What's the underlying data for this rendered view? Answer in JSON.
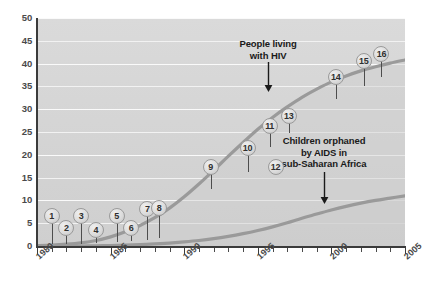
{
  "chart_data": {
    "type": "line",
    "title": "",
    "xlabel": "",
    "ylabel": "",
    "xlim": [
      1980,
      2005
    ],
    "ylim": [
      0,
      50
    ],
    "grid": true,
    "legend_position": "inline-annotations",
    "y_ticks": [
      0,
      5,
      10,
      15,
      20,
      25,
      30,
      35,
      40,
      45,
      50
    ],
    "x_ticks": [
      1980,
      1985,
      1990,
      1995,
      2000,
      2005
    ],
    "x_tick_labels": [
      "1980",
      "1985",
      "1990",
      "1995",
      "2000",
      "2005"
    ],
    "series": [
      {
        "name": "People living with HIV",
        "color": "#9a9a9a",
        "x": [
          1980,
          1981,
          1982,
          1983,
          1984,
          1985,
          1986,
          1987,
          1988,
          1989,
          1990,
          1991,
          1992,
          1993,
          1994,
          1995,
          1996,
          1997,
          1998,
          1999,
          2000,
          2001,
          2002,
          2003,
          2004,
          2005
        ],
        "values": [
          0.1,
          0.2,
          0.4,
          0.7,
          1.2,
          2.0,
          3.1,
          4.5,
          6.2,
          8.3,
          10.8,
          13.6,
          16.6,
          19.7,
          22.7,
          25.6,
          28.2,
          30.5,
          32.6,
          34.4,
          36.0,
          37.3,
          38.4,
          39.3,
          40.1,
          40.8
        ]
      },
      {
        "name": "Children orphaned by AIDS in sub-Saharan Africa",
        "color": "#9a9a9a",
        "x": [
          1980,
          1981,
          1982,
          1983,
          1984,
          1985,
          1986,
          1987,
          1988,
          1989,
          1990,
          1991,
          1992,
          1993,
          1994,
          1995,
          1996,
          1997,
          1998,
          1999,
          2000,
          2001,
          2002,
          2003,
          2004,
          2005
        ],
        "values": [
          0.0,
          0.0,
          0.0,
          0.0,
          0.05,
          0.1,
          0.2,
          0.3,
          0.45,
          0.65,
          0.9,
          1.2,
          1.6,
          2.1,
          2.7,
          3.4,
          4.2,
          5.1,
          6.1,
          7.0,
          7.9,
          8.7,
          9.4,
          10.0,
          10.5,
          11.0
        ]
      }
    ],
    "annotations": [
      {
        "id": "hiv-callout",
        "text_lines": [
          "People living",
          "with HIV"
        ],
        "x": 1995.7,
        "points_to_series": "People living with HIV"
      },
      {
        "id": "orphans-callout",
        "text_lines": [
          "Children orphaned",
          "by AIDS in",
          "sub-Saharan Africa"
        ],
        "x": 1999.5,
        "points_to_series": "Children orphaned by AIDS in sub-Saharan Africa"
      }
    ],
    "event_markers": [
      {
        "label": "1",
        "x": 1981.0,
        "bubble_y": 6.6,
        "anchor_y": 0.4
      },
      {
        "label": "2",
        "x": 1982.0,
        "bubble_y": 4.0,
        "anchor_y": 0.4
      },
      {
        "label": "3",
        "x": 1983.0,
        "bubble_y": 6.6,
        "anchor_y": 0.5
      },
      {
        "label": "4",
        "x": 1984.0,
        "bubble_y": 3.5,
        "anchor_y": 0.6
      },
      {
        "label": "5",
        "x": 1985.4,
        "bubble_y": 6.6,
        "anchor_y": 0.8
      },
      {
        "label": "6",
        "x": 1986.4,
        "bubble_y": 4.0,
        "anchor_y": 1.0
      },
      {
        "label": "7",
        "x": 1987.5,
        "bubble_y": 8.2,
        "anchor_y": 1.4
      },
      {
        "label": "8",
        "x": 1988.3,
        "bubble_y": 8.4,
        "anchor_y": 1.7
      },
      {
        "label": "9",
        "x": 1991.8,
        "bubble_y": 17.4,
        "anchor_y": 12.6
      },
      {
        "label": "10",
        "x": 1994.3,
        "bubble_y": 21.6,
        "anchor_y": 16.2
      },
      {
        "label": "11",
        "x": 1995.8,
        "bubble_y": 26.3,
        "anchor_y": 21.6
      },
      {
        "label": "12",
        "x": 1996.2,
        "bubble_y": 17.4,
        "anchor_y": 24.3
      },
      {
        "label": "13",
        "x": 1997.1,
        "bubble_y": 28.5,
        "anchor_y": 24.8
      },
      {
        "label": "14",
        "x": 2000.3,
        "bubble_y": 37.0,
        "anchor_y": 32.2
      },
      {
        "label": "15",
        "x": 2002.2,
        "bubble_y": 40.5,
        "anchor_y": 35.2
      },
      {
        "label": "16",
        "x": 2003.4,
        "bubble_y": 42.0,
        "anchor_y": 37.0
      }
    ]
  },
  "colors": {
    "plot_background": "#d6d6d6",
    "gridline": "#f2f2f2",
    "axis": "#3b3b3b",
    "curve": "#9a9a9a",
    "text": "#1a1a1a",
    "tick_text": "#4a4a4a",
    "marker_fill": "#dcdcdc",
    "marker_border": "#9a9a9a"
  }
}
